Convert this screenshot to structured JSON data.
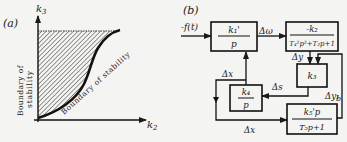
{
  "panel_a": {
    "label": "(a)",
    "y_axis_label": "k",
    "y_axis_sub": "3",
    "x_axis_label": "k",
    "x_axis_sub": "2",
    "vertical_boundary_line1": "Boundary of",
    "vertical_boundary_line2": "stability",
    "curve_label": "Boundary of stability"
  },
  "panel_b": {
    "label": "(b)",
    "input": "-f(t)",
    "blocks": {
      "k1": {
        "num": "k₁'",
        "den": "p"
      },
      "k2": {
        "num": "-k₂",
        "den": "T₄²p²+T₂p+1"
      },
      "k3": {
        "num": "k₃"
      },
      "k4": {
        "num": "k₄",
        "den": "p"
      },
      "k5": {
        "num": "k₅'p",
        "den": "T₅p+1"
      }
    },
    "signals": {
      "domega": "Δω",
      "dy": "Δy",
      "dy1": "Δy₁",
      "b": "b",
      "ds": "Δs",
      "dx_top": "Δx",
      "dx_bottom": "Δx"
    }
  }
}
